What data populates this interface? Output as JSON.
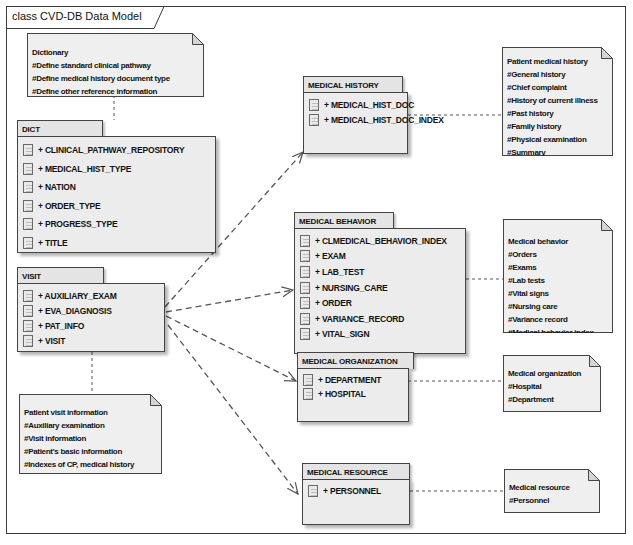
{
  "diagram": {
    "title": "class CVD-DB Data Model",
    "packages": {
      "dict": {
        "name": "DICT",
        "items": [
          "+ CLINICAL_PATHWAY_REPOSITORY",
          "+ MEDICAL_HIST_TYPE",
          "+ NATION",
          "+ ORDER_TYPE",
          "+ PROGRESS_TYPE",
          "+ TITLE"
        ]
      },
      "visit": {
        "name": "VISIT",
        "items": [
          "+ AUXILIARY_EXAM",
          "+ EVA_DIAGNOSIS",
          "+ PAT_INFO",
          "+ VISIT"
        ]
      },
      "medical_history": {
        "name": "MEDICAL HISTORY",
        "items": [
          "+ MEDICAL_HIST_DOC",
          "+ MEDICAL_HIST_DOC_INDEX"
        ]
      },
      "medical_behavior": {
        "name": "MEDICAL BEHAVIOR",
        "items": [
          "+ CLMEDICAL_BEHAVIOR_INDEX",
          "+ EXAM",
          "+ LAB_TEST",
          "+ NURSING_CARE",
          "+ ORDER",
          "+ VARIANCE_RECORD",
          "+ VITAL_SIGN"
        ]
      },
      "medical_organization": {
        "name": "MEDICAL ORGANIZATION",
        "items": [
          "+ DEPARTMENT",
          "+ HOSPITAL"
        ]
      },
      "medical_resource": {
        "name": "MEDICAL RESOURCE",
        "items": [
          "+ PERSONNEL"
        ]
      }
    },
    "notes": {
      "dict": [
        "Dictionary",
        "#Define standard clinical pathway",
        "#Define medical history document type",
        "#Define other reference information"
      ],
      "visit": [
        "Patient visit information",
        "#Auxiliary examination",
        "#Visit information",
        "#Patient's basic information",
        "#Indexes of CP, medical history"
      ],
      "medical_history": [
        "Patient medical history",
        "#General history",
        "#Chief complaint",
        "#History of current illness",
        "#Past history",
        "#Family history",
        "#Physical examination",
        "#Summary"
      ],
      "medical_behavior": [
        "Medical behavior",
        "#Orders",
        "#Exams",
        "#Lab tests",
        "#Vital signs",
        "#Nursing care",
        "#Variance record",
        "#Medical behavior index"
      ],
      "medical_organization": [
        "Medical organization",
        "#Hospital",
        "#Department"
      ],
      "medical_resource": [
        "Medical resource",
        "#Personnel"
      ]
    },
    "dependencies": [
      {
        "from": "VISIT",
        "to": "MEDICAL HISTORY"
      },
      {
        "from": "VISIT",
        "to": "MEDICAL BEHAVIOR"
      },
      {
        "from": "VISIT",
        "to": "MEDICAL ORGANIZATION"
      },
      {
        "from": "VISIT",
        "to": "MEDICAL RESOURCE"
      }
    ],
    "colors": {
      "package_fill": "#ececec",
      "note_fill": "#efefef",
      "border": "#444444",
      "link": "#555555"
    }
  }
}
